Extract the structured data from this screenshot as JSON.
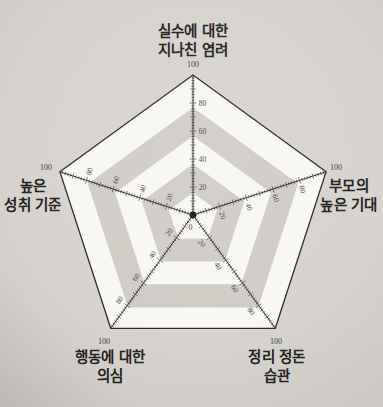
{
  "chart_data": {
    "type": "radar",
    "title": "",
    "axes": [
      {
        "key": "concern-over-mistakes",
        "label_lines": [
          "실수에 대한",
          "지나친 염려"
        ]
      },
      {
        "key": "parental-expectations",
        "label_lines": [
          "부모의",
          "높은 기대"
        ]
      },
      {
        "key": "organization",
        "label_lines": [
          "정리 정돈",
          "습관"
        ]
      },
      {
        "key": "doubts-about-actions",
        "label_lines": [
          "행동에 대한",
          "의심"
        ]
      },
      {
        "key": "personal-standards",
        "label_lines": [
          "높은",
          "성취 기준"
        ]
      }
    ],
    "scale": {
      "min": 0,
      "max": 100,
      "labeled_ticks": [
        20,
        40,
        60,
        80
      ],
      "minor_tick_step": 2,
      "max_label": "100",
      "min_label": "0"
    },
    "series": [],
    "rings": {
      "band_boundaries_pct": [
        100,
        79,
        58.5,
        38.5,
        18
      ],
      "band_colors": [
        "#f8f7f3",
        "#d0cdc7",
        "#f8f7f3",
        "#d0cdc7",
        "#f8f7f3"
      ]
    },
    "legend": null
  },
  "colors": {
    "page_bg": "#d7d4cf",
    "outline": "#2e2d2b",
    "axis_line": "#34332f",
    "label_text": "#24231f",
    "tick_text": "#3f3e3a"
  }
}
